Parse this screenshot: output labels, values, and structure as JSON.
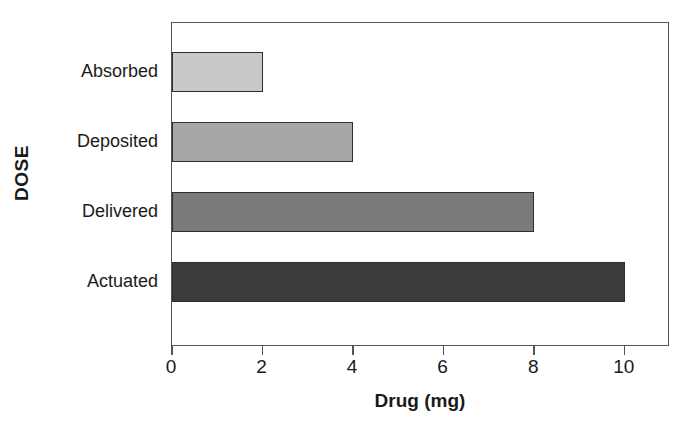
{
  "chart_data": {
    "type": "bar",
    "orientation": "horizontal",
    "title": "",
    "xlabel": "Drug (mg)",
    "ylabel": "DOSE",
    "categories": [
      "Actuated",
      "Delivered",
      "Deposited",
      "Absorbed"
    ],
    "values": [
      10,
      8,
      4,
      2
    ],
    "bars": [
      {
        "category": "Absorbed",
        "value": 2,
        "color": "#c9c9c9",
        "border": "#2e2e2e"
      },
      {
        "category": "Deposited",
        "value": 4,
        "color": "#a7a7a7",
        "border": "#2e2e2e"
      },
      {
        "category": "Delivered",
        "value": 8,
        "color": "#7a7a7a",
        "border": "#2e2e2e"
      },
      {
        "category": "Actuated",
        "value": 10,
        "color": "#3c3c3c",
        "border": "#2e2e2e"
      }
    ],
    "xlim": [
      0,
      11
    ],
    "xticks": [
      0,
      2,
      4,
      6,
      8,
      10
    ],
    "xtick_labels": [
      "0",
      "2",
      "4",
      "6",
      "8",
      "10"
    ],
    "ytick_labels": [
      "Absorbed",
      "Deposited",
      "Delivered",
      "Actuated"
    ],
    "grid": false,
    "legend": false,
    "frame": "full-rectangle",
    "background_color": "#ffffff",
    "axis_color": "#555555",
    "text_color": "#1a1a1a"
  }
}
